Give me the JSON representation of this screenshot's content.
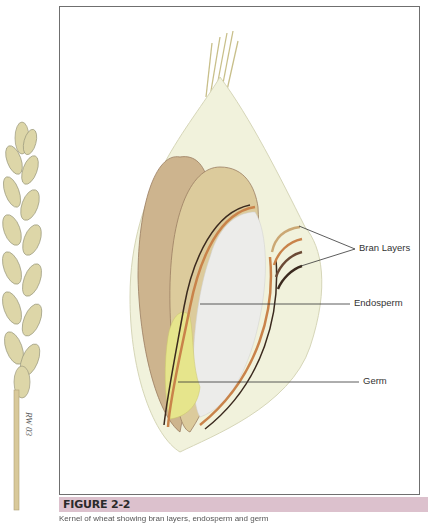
{
  "figure": {
    "caption_title": "FIGURE 2-2",
    "caption_text": "Kernel of wheat showing bran layers, endosperm and germ",
    "signature": "RW 03"
  },
  "labels": {
    "bran": "Bran Layers",
    "endosperm": "Endosperm",
    "germ": "Germ"
  },
  "colors": {
    "caption_bar": "#dcc1cd",
    "husk": "#f1f2dc",
    "kernel": "#d9c49a",
    "bran_orange": "#c9834a",
    "bran_dark": "#3b2a1e",
    "endosperm": "#ececea",
    "germ": "#e6e58c"
  }
}
